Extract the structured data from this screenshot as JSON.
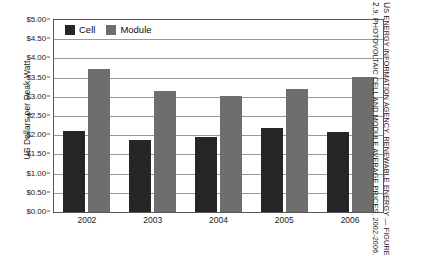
{
  "chart_data": {
    "type": "bar",
    "title": "",
    "xlabel": "",
    "ylabel": "US Dollars per Peak Watt",
    "categories": [
      "2002",
      "2003",
      "2004",
      "2005",
      "2006"
    ],
    "series": [
      {
        "name": "Cell",
        "values": [
          2.12,
          1.88,
          1.95,
          2.19,
          2.08
        ],
        "color": "#262626"
      },
      {
        "name": "Module",
        "values": [
          3.73,
          3.16,
          3.02,
          3.2,
          3.51
        ],
        "color": "#6e6e6e"
      }
    ],
    "ylim": [
      0,
      5
    ],
    "ytick_step": 0.5,
    "ytick_labels": [
      "$0.00",
      "$0.50",
      "$1.00",
      "$1.50",
      "$2.00",
      "$2.50",
      "$3.00",
      "$3.50",
      "$4.00",
      "$4.50",
      "$5.00"
    ],
    "ytick_values": [
      0,
      0.5,
      1,
      1.5,
      2,
      2.5,
      3,
      3.5,
      4,
      4.5,
      5
    ],
    "grid": true,
    "legend_position": "top-left"
  },
  "legend": {
    "items": [
      {
        "label": "Cell"
      },
      {
        "label": "Module"
      }
    ]
  },
  "caption": {
    "line1": "US Energy Information Agency, Renewable Energy — Figure",
    "line2": "2.9, Photovoltaic Cell and Module Average Prices, 2002-2006."
  }
}
